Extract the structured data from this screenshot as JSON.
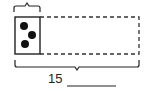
{
  "diagram": {
    "type": "tape-diagram",
    "total_label": "15",
    "answer_blank": "",
    "known_part": {
      "dots": 3
    },
    "unknown_part": {
      "style": "dashed"
    },
    "colors": {
      "stroke": "#222222",
      "dot": "#111111",
      "background": "#ffffff"
    }
  }
}
